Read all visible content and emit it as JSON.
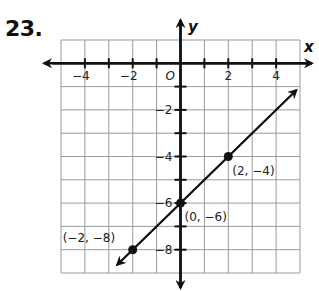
{
  "problem": {
    "number": "23."
  },
  "axes": {
    "x_label": "x",
    "y_label": "y",
    "origin_label": "O",
    "x_tick_labels": [
      {
        "value": -4,
        "text": "−4"
      },
      {
        "value": -2,
        "text": "−2"
      },
      {
        "value": 2,
        "text": "2"
      },
      {
        "value": 4,
        "text": "4"
      }
    ],
    "y_tick_labels": [
      {
        "value": -2,
        "text": "−2"
      },
      {
        "value": -4,
        "text": "−4"
      },
      {
        "value": -6,
        "text": "−6"
      },
      {
        "value": -8,
        "text": "−8"
      }
    ]
  },
  "points": [
    {
      "x": -2,
      "y": -8,
      "label": "(−2, −8)"
    },
    {
      "x": 0,
      "y": -6,
      "label": "(0, −6)"
    },
    {
      "x": 2,
      "y": -4,
      "label": "(2, −4)"
    }
  ],
  "chart_data": {
    "type": "line",
    "title": "23.",
    "xlabel": "x",
    "ylabel": "y",
    "xlim": [
      -5,
      5
    ],
    "ylim": [
      -9,
      1
    ],
    "grid": true,
    "x_ticks": [
      -4,
      -2,
      2,
      4
    ],
    "y_ticks": [
      -2,
      -4,
      -6,
      -8
    ],
    "series": [
      {
        "name": "y = x - 6",
        "x": [
          -2,
          0,
          2
        ],
        "y": [
          -8,
          -6,
          -4
        ],
        "line_extends": "both directions (arrows)"
      }
    ],
    "annotations": [
      "(−2, −8)",
      "(0, −6)",
      "(2, −4)"
    ]
  }
}
